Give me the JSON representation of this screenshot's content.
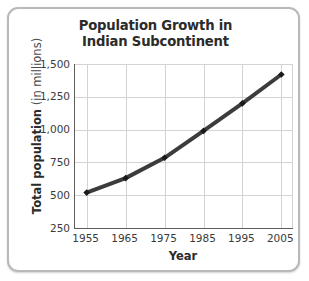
{
  "chart_data": {
    "type": "line",
    "title": "Population Growth in Indian Subcontinent",
    "title_lines": [
      "Population Growth in",
      "Indian Subcontinent"
    ],
    "xlabel": "Year",
    "ylabel": "Total population (in millions)",
    "ylabel_strong": "Total population",
    "ylabel_light": " (in millions)",
    "x": [
      1955,
      1965,
      1975,
      1985,
      1995,
      2005
    ],
    "values": [
      520,
      630,
      785,
      990,
      1200,
      1420
    ],
    "categories": [
      "1955",
      "1965",
      "1975",
      "1985",
      "1995",
      "2005"
    ],
    "xtick_labels": [
      "1955",
      "1965",
      "1975",
      "1985",
      "1995",
      "2005"
    ],
    "ytick_labels": [
      "1,500",
      "1,250",
      "1,000",
      "750",
      "500",
      "250"
    ],
    "ytick_values": [
      1500,
      1250,
      1000,
      750,
      500,
      250
    ],
    "xlim": [
      1952,
      2008
    ],
    "ylim": [
      250,
      1500
    ],
    "grid": true,
    "legend": false,
    "series": [
      {
        "name": "Total population",
        "values": [
          520,
          630,
          785,
          990,
          1200,
          1420
        ]
      }
    ],
    "colors": {
      "line": "#3c3c3c",
      "marker": "#1a1a1a",
      "grid": "#d3d3d3",
      "axis": "#5d5d5d",
      "text": "#2b2b2b",
      "frame": "#b9b9b9",
      "background": "#ffffff"
    },
    "marker_style": "diamond",
    "line_width_px": 4
  }
}
